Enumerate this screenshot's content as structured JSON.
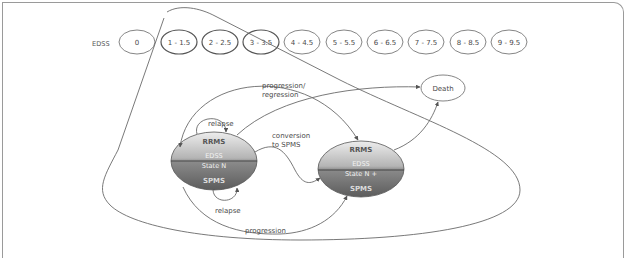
{
  "edss_scale": {
    "label": "EDSS",
    "levels": [
      "0",
      "1 - 1.5",
      "2 - 2.5",
      "3 - 3.5",
      "4 - 4.5",
      "5 - 5.5",
      "6 - 6.5",
      "7 - 7.5",
      "8 - 8.5",
      "9 - 9.5"
    ]
  },
  "states": {
    "current": {
      "top": "RRMS",
      "mid1": "EDSS",
      "mid2": "State N",
      "bottom": "SPMS"
    },
    "next": {
      "top": "RRMS",
      "mid1": "EDSS",
      "mid2": "State N +",
      "bottom": "SPMS"
    },
    "death": "Death"
  },
  "transitions": {
    "progression_regression_1": "progression/",
    "progression_regression_2": "regression",
    "relapse_top": "relapse",
    "relapse_bottom": "relapse",
    "conversion_1": "conversion",
    "conversion_2": "to SPMS",
    "progression": "progression"
  },
  "colors": {
    "ellipse_top": "#e6e6e6",
    "ellipse_bottom": "#6e6e6e",
    "stroke": "#6a6a6a",
    "divider": "#444444"
  }
}
